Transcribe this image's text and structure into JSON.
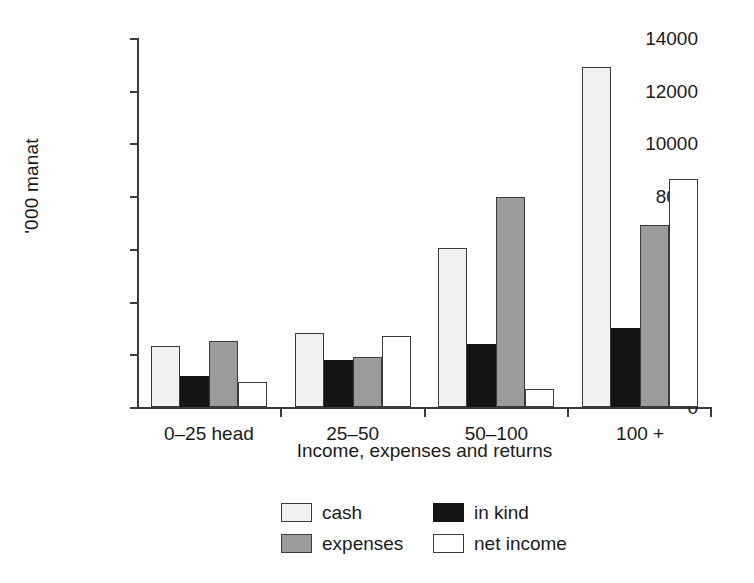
{
  "chart_data": {
    "type": "bar",
    "title": "",
    "subtitle": "",
    "xlabel": "Income, expenses and returns",
    "ylabel": "'000 manat",
    "categories": [
      "0–25 head",
      "25–50",
      "50–100",
      "100 +"
    ],
    "series": [
      {
        "name": "cash",
        "color": "#f1f1ef",
        "values": [
          2300,
          2800,
          6050,
          12900
        ]
      },
      {
        "name": "in kind",
        "color": "#141414",
        "values": [
          1180,
          1790,
          2390,
          3010
        ]
      },
      {
        "name": "expenses",
        "color": "#9b9b9b",
        "values": [
          2500,
          1880,
          7950,
          6900
        ]
      },
      {
        "name": "net income",
        "color": "#ffffff",
        "values": [
          950,
          2700,
          700,
          8650
        ]
      }
    ],
    "ylim": [
      0,
      14000
    ],
    "yticks": [
      0,
      2000,
      4000,
      6000,
      8000,
      10000,
      12000,
      14000
    ],
    "ytick_labels": [
      "0",
      "2000",
      "4000",
      "6000",
      "8000",
      "10000",
      "12000",
      "14000"
    ],
    "grid": false,
    "legend_position": "bottom-center",
    "legend_entries": [
      "cash",
      "in kind",
      "expenses",
      "net income"
    ],
    "axis_color": "#3b3b3b",
    "background": "#ffffff"
  },
  "legend": {
    "row1": {
      "left_label": "cash",
      "right_label": "in kind"
    },
    "row2": {
      "left_label": "expenses",
      "right_label": "net income"
    }
  },
  "axes": {
    "y_label": "'000 manat",
    "x_label": "Income, expenses and returns",
    "y_ticks": [
      "14000",
      "12000",
      "10000",
      "8000",
      "6000",
      "4000",
      "2000",
      "0"
    ],
    "x_categories": [
      "0–25 head",
      "25–50",
      "50–100",
      "100 +"
    ]
  }
}
